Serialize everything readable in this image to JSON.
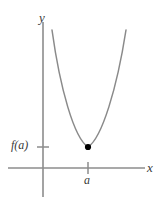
{
  "figure": {
    "kind": "math-graph",
    "background_color": "#ffffff",
    "axis_color": "#8c8c8c",
    "curve_color": "#8a8a8a",
    "point_color": "#000000",
    "label_color": "#3a3a3a"
  },
  "labels": {
    "y_axis": "y",
    "x_axis": "x",
    "x_tick": "a",
    "y_tick": "f(a)"
  },
  "chart_data": {
    "type": "line",
    "title": "",
    "xlabel": "x",
    "ylabel": "y",
    "grid": false,
    "legend": null,
    "annotations": [
      {
        "label": "a",
        "axis": "x",
        "position": 88
      },
      {
        "label": "f(a)",
        "axis": "y",
        "position": 147
      }
    ],
    "points": [
      {
        "label": "minimum",
        "x": 88,
        "y": 147,
        "marker": "filled-circle"
      }
    ],
    "series": [
      {
        "name": "f",
        "path": "M52,30 C60,88 74,138 88,147 C102,138 117,88 126,30"
      }
    ],
    "axes": {
      "x_axis_y": 168,
      "y_axis_x": 43,
      "x_axis_from": 8,
      "x_axis_to": 145,
      "y_axis_from": 22,
      "y_axis_to": 197
    }
  }
}
